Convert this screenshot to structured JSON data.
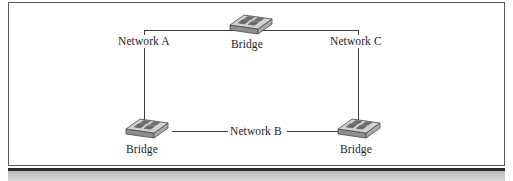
{
  "figure": {
    "kind": "network-topology-diagram",
    "frame": {
      "border_color": "#5a5a5a",
      "background_color": "#ffffff"
    },
    "page_rule_color": "#2b2b2b",
    "page_band_color": "#c9c9c9"
  },
  "diagram": {
    "line_color": "#3c3c3c",
    "device_fill_top": "#d0d0d0",
    "device_fill_front": "#9a9a9a",
    "device_fill_side": "#b5b5b5",
    "device_outline": "#4a4a4a",
    "networks": [
      {
        "id": "network-a",
        "label": "Network A"
      },
      {
        "id": "network-b",
        "label": "Network B"
      },
      {
        "id": "network-c",
        "label": "Network C"
      }
    ],
    "devices": [
      {
        "id": "bridge-top",
        "label": "Bridge",
        "icon": "bridge-device-icon",
        "position": "top-center"
      },
      {
        "id": "bridge-left",
        "label": "Bridge",
        "icon": "bridge-device-icon",
        "position": "bottom-left"
      },
      {
        "id": "bridge-right",
        "label": "Bridge",
        "icon": "bridge-device-icon",
        "position": "bottom-right"
      }
    ],
    "links": [
      {
        "id": "link-top-bus",
        "from": "network-a",
        "to": "network-c",
        "via": "bridge-top",
        "orientation": "horizontal"
      },
      {
        "id": "link-left-riser",
        "from": "network-a",
        "to": "bridge-left",
        "orientation": "vertical"
      },
      {
        "id": "link-right-riser",
        "from": "network-c",
        "to": "bridge-right",
        "orientation": "vertical"
      },
      {
        "id": "link-netb-left",
        "from": "bridge-left",
        "to": "network-b",
        "orientation": "horizontal"
      },
      {
        "id": "link-netb-right",
        "from": "network-b",
        "to": "bridge-right",
        "orientation": "horizontal"
      }
    ]
  }
}
